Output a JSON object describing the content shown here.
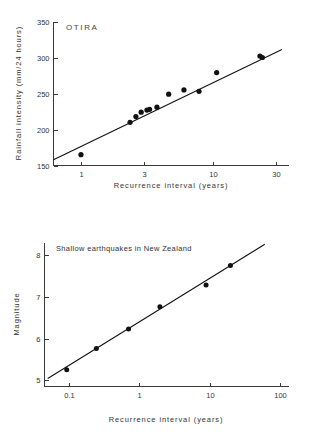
{
  "chart_data": [
    {
      "type": "scatter",
      "title": "OTIRA",
      "xlabel": "Recurrence interval (years)",
      "ylabel": "Rainfall intensity (mm/24 hours)",
      "xscale": "log",
      "yscale": "linear",
      "xlim": [
        0.62,
        37
      ],
      "ylim": [
        150,
        350
      ],
      "xticks": [
        1,
        3,
        10,
        30
      ],
      "xtick_labels": [
        "1",
        "3",
        "10",
        "30"
      ],
      "yticks": [
        150,
        200,
        250,
        300,
        350
      ],
      "ytick_labels": [
        "150",
        "200",
        "250",
        "300",
        "350"
      ],
      "grid": false,
      "legend": "none",
      "points": [
        {
          "x": 1.0,
          "y": 165
        },
        {
          "x": 2.35,
          "y": 210
        },
        {
          "x": 2.6,
          "y": 218
        },
        {
          "x": 2.85,
          "y": 224
        },
        {
          "x": 3.15,
          "y": 227
        },
        {
          "x": 3.3,
          "y": 228
        },
        {
          "x": 3.75,
          "y": 231
        },
        {
          "x": 4.6,
          "y": 249
        },
        {
          "x": 6.0,
          "y": 255
        },
        {
          "x": 7.8,
          "y": 253
        },
        {
          "x": 10.6,
          "y": 279
        },
        {
          "x": 22.5,
          "y": 302
        },
        {
          "x": 23.5,
          "y": 300
        }
      ],
      "fit_line": {
        "x1": 0.62,
        "y1": 158,
        "x2": 33,
        "y2": 311
      }
    },
    {
      "type": "scatter",
      "title": "Shallow earthquakes in New Zealand",
      "xlabel": "Recurrence interval  (years)",
      "ylabel": "Magnitude",
      "xscale": "log",
      "yscale": "linear",
      "xlim": [
        0.045,
        130
      ],
      "ylim": [
        4.85,
        8.3
      ],
      "xticks": [
        0.1,
        1,
        10,
        100
      ],
      "xtick_labels": [
        "0.1",
        "1",
        "10",
        "100"
      ],
      "yticks": [
        5,
        6,
        7,
        8
      ],
      "ytick_labels": [
        "5",
        "6",
        "7",
        "8"
      ],
      "grid": false,
      "legend": "none",
      "points": [
        {
          "x": 0.093,
          "y": 5.25
        },
        {
          "x": 0.245,
          "y": 5.76
        },
        {
          "x": 0.7,
          "y": 6.23
        },
        {
          "x": 1.95,
          "y": 6.76
        },
        {
          "x": 8.8,
          "y": 7.28
        },
        {
          "x": 19.5,
          "y": 7.75
        }
      ],
      "fit_line": {
        "x1": 0.05,
        "y1": 5.04,
        "x2": 60,
        "y2": 8.26
      }
    }
  ]
}
